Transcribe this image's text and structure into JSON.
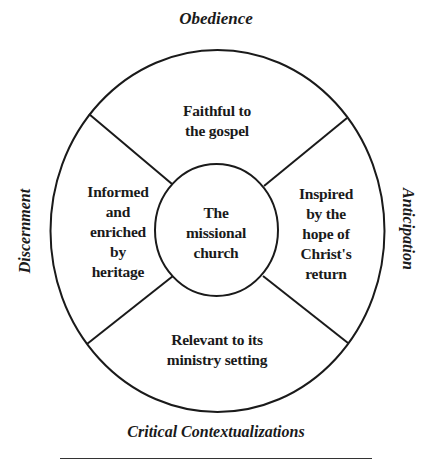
{
  "diagram": {
    "type": "concentric-segmented-circle",
    "center_label": {
      "lines": [
        "The",
        "missional",
        "church"
      ]
    },
    "segments": [
      {
        "position": "top",
        "lines": [
          "Faithful to",
          "the gospel"
        ]
      },
      {
        "position": "left",
        "lines": [
          "Informed",
          "and",
          "enriched",
          "by",
          "heritage"
        ]
      },
      {
        "position": "right",
        "lines": [
          "Inspired",
          "by the",
          "hope of",
          "Christ's",
          "return"
        ]
      },
      {
        "position": "bottom",
        "lines": [
          "Relevant to its",
          "ministry setting"
        ]
      }
    ],
    "axes": {
      "top": "Obedience",
      "left": "Discernment",
      "right": "Anticipation",
      "bottom": "Critical Contextualizations"
    },
    "colors": {
      "stroke": "#1a1a1a",
      "text": "#1a1a1a",
      "background": "#ffffff"
    }
  }
}
